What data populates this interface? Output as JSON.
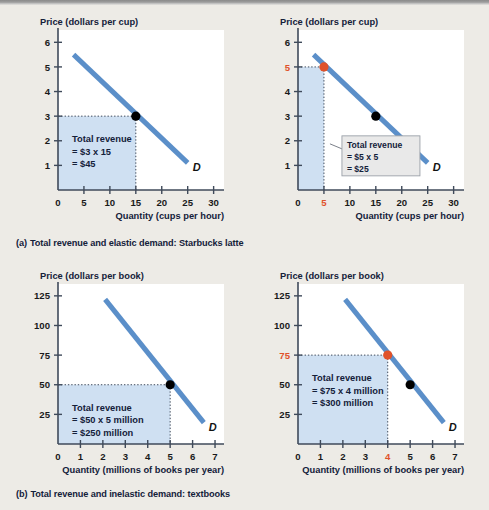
{
  "figure": {
    "background_color": "#edebe6",
    "plot_background_color": "#ffffff",
    "curve_color": "#5b8fc9",
    "shade_color": "#cfe0f2",
    "highlight_color": "#e0522a",
    "point_color": "#000000",
    "axis_color": "#3f4a5a"
  },
  "sections": [
    {
      "caption_letter": "(a)",
      "caption_text": "Total revenue and elastic demand: Starbucks latte"
    },
    {
      "caption_letter": "(b)",
      "caption_text": "Total revenue and inelastic demand: textbooks"
    }
  ],
  "chart_data": [
    {
      "id": "latte-elastic-3",
      "type": "line",
      "title": "",
      "ylabel": "Price (dollars per cup)",
      "xlabel": "Quantity (cups per hour)",
      "xlim": [
        0,
        32
      ],
      "ylim": [
        0,
        6.5
      ],
      "xticks": [
        0,
        5,
        10,
        15,
        20,
        25,
        30
      ],
      "yticks": [
        1,
        2,
        3,
        4,
        5,
        6
      ],
      "highlight_xticks": [],
      "highlight_yticks": [],
      "grid": false,
      "series": [
        {
          "name": "D",
          "label": "D",
          "x": [
            3,
            25
          ],
          "y": [
            5.5,
            1.1
          ]
        }
      ],
      "marked_point": {
        "x": 15,
        "y": 3,
        "style": "black"
      },
      "other_points": [],
      "revenue_rect": {
        "x": 15,
        "y": 3
      },
      "revenue_label": {
        "line1": "Total revenue",
        "line2": "= $3 x 15",
        "line3": "= $45",
        "style": "inline"
      }
    },
    {
      "id": "latte-elastic-5",
      "type": "line",
      "title": "",
      "ylabel": "Price (dollars per cup)",
      "xlabel": "Quantity (cups per hour)",
      "xlim": [
        0,
        32
      ],
      "ylim": [
        0,
        6.5
      ],
      "xticks": [
        0,
        5,
        10,
        15,
        20,
        25,
        30
      ],
      "yticks": [
        1,
        2,
        3,
        4,
        5,
        6
      ],
      "highlight_xticks": [
        5
      ],
      "highlight_yticks": [
        5
      ],
      "grid": false,
      "series": [
        {
          "name": "D",
          "label": "D",
          "x": [
            3,
            25
          ],
          "y": [
            5.5,
            1.1
          ]
        }
      ],
      "marked_point": {
        "x": 5,
        "y": 5,
        "style": "highlight"
      },
      "other_points": [
        {
          "x": 15,
          "y": 3,
          "style": "black"
        }
      ],
      "revenue_rect": {
        "x": 5,
        "y": 5
      },
      "revenue_label": {
        "line1": "Total revenue",
        "line2": "= $5 x 5",
        "line3": "= $25",
        "style": "callout"
      }
    },
    {
      "id": "textbooks-inelastic-50",
      "type": "line",
      "title": "",
      "ylabel": "Price (dollars per book)",
      "xlabel": "Quantity (millions of books per year)",
      "xlim": [
        0,
        7.4
      ],
      "ylim": [
        0,
        135
      ],
      "xticks": [
        0,
        1,
        2,
        3,
        4,
        5,
        6,
        7
      ],
      "yticks": [
        25,
        50,
        75,
        100,
        125
      ],
      "highlight_xticks": [],
      "highlight_yticks": [],
      "grid": false,
      "series": [
        {
          "name": "D",
          "label": "D",
          "x": [
            2.1,
            6.5
          ],
          "y": [
            122,
            18
          ]
        }
      ],
      "marked_point": {
        "x": 5,
        "y": 50,
        "style": "black"
      },
      "other_points": [],
      "revenue_rect": {
        "x": 5,
        "y": 50
      },
      "revenue_label": {
        "line1": "Total revenue",
        "line2": "= $50 x 5 million",
        "line3": "= $250 million",
        "style": "inline"
      }
    },
    {
      "id": "textbooks-inelastic-75",
      "type": "line",
      "title": "",
      "ylabel": "Price (dollars per book)",
      "xlabel": "Quantity (millions of books per year)",
      "xlim": [
        0,
        7.4
      ],
      "ylim": [
        0,
        135
      ],
      "xticks": [
        0,
        1,
        2,
        3,
        4,
        5,
        6,
        7
      ],
      "yticks": [
        25,
        50,
        75,
        100,
        125
      ],
      "highlight_xticks": [
        4
      ],
      "highlight_yticks": [
        75
      ],
      "grid": false,
      "series": [
        {
          "name": "D",
          "label": "D",
          "x": [
            2.1,
            6.5
          ],
          "y": [
            122,
            18
          ]
        }
      ],
      "marked_point": {
        "x": 4,
        "y": 75,
        "style": "highlight"
      },
      "other_points": [
        {
          "x": 5,
          "y": 50,
          "style": "black"
        }
      ],
      "revenue_rect": {
        "x": 4,
        "y": 75
      },
      "revenue_label": {
        "line1": "Total revenue",
        "line2": "= $75 x 4 million",
        "line3": "= $300 million",
        "style": "inline"
      }
    }
  ]
}
